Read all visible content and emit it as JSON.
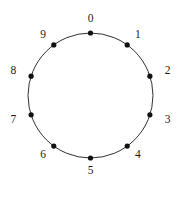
{
  "figure": {
    "type": "cycle-graph-diagram",
    "background_color": "#ffffff",
    "stroke_color": "#1a1a1a",
    "dot_color": "#111111",
    "label_color": "#1a1a1a",
    "canvas": {
      "width": 183,
      "height": 200
    },
    "circle": {
      "cx": 90.5,
      "cy": 95.5,
      "r": 62.5,
      "stroke_width": 0.9
    },
    "dot_radius": 2.6,
    "label_offset": 18,
    "vertex_count": 10,
    "start_angle_deg": -90,
    "direction": "clockwise",
    "vertices": [
      {
        "label": "0",
        "angle_deg": -90,
        "dot_x": 90.5,
        "dot_y": 33.0,
        "label_x": 90.5,
        "label_y": 19.3
      },
      {
        "label": "1",
        "angle_deg": -54,
        "dot_x": 127.2,
        "dot_y": 44.9,
        "label_x": 137.8,
        "label_y": 35.4
      },
      {
        "label": "2",
        "angle_deg": -18,
        "dot_x": 149.9,
        "dot_y": 76.2,
        "label_x": 167.6,
        "label_y": 70.9
      },
      {
        "label": "3",
        "angle_deg": 18,
        "dot_x": 149.9,
        "dot_y": 114.8,
        "label_x": 167.6,
        "label_y": 120.1
      },
      {
        "label": "4",
        "angle_deg": 54,
        "dot_x": 127.2,
        "dot_y": 146.1,
        "label_x": 137.8,
        "label_y": 155.6
      },
      {
        "label": "5",
        "angle_deg": 90,
        "dot_x": 90.5,
        "dot_y": 158.0,
        "label_x": 90.5,
        "label_y": 171.7
      },
      {
        "label": "6",
        "angle_deg": 126,
        "dot_x": 53.8,
        "dot_y": 146.1,
        "label_x": 43.2,
        "label_y": 155.6
      },
      {
        "label": "7",
        "angle_deg": 162,
        "dot_x": 31.1,
        "dot_y": 114.8,
        "label_x": 13.4,
        "label_y": 120.1
      },
      {
        "label": "8",
        "angle_deg": 198,
        "dot_x": 31.1,
        "dot_y": 76.2,
        "label_x": 13.4,
        "label_y": 70.9
      },
      {
        "label": "9",
        "angle_deg": 234,
        "dot_x": 53.8,
        "dot_y": 44.9,
        "label_x": 43.2,
        "label_y": 35.4
      }
    ]
  }
}
